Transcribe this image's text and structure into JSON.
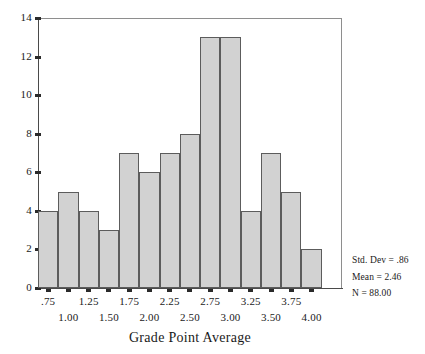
{
  "chart_data": {
    "type": "bar",
    "title": "",
    "xlabel": "Grade Point Average",
    "ylabel": "",
    "ylim": [
      0,
      14
    ],
    "grid": false,
    "legend": "none",
    "bin_width": 0.25,
    "categories": [
      "0.75",
      "1.00",
      "1.25",
      "1.50",
      "1.75",
      "2.00",
      "2.25",
      "2.50",
      "2.75",
      "3.00",
      "3.25",
      "3.50",
      "3.75",
      "4.00"
    ],
    "values": [
      4,
      5,
      4,
      3,
      7,
      6,
      7,
      8,
      13,
      13,
      4,
      7,
      5,
      2
    ],
    "y_ticks": [
      "0",
      "2",
      "4",
      "6",
      "8",
      "10",
      "12",
      "14"
    ],
    "y_tick_values": [
      0,
      2,
      4,
      6,
      8,
      10,
      12,
      14
    ],
    "x_ticks_upper": [
      ".75",
      "1.25",
      "1.75",
      "2.25",
      "2.75",
      "3.25",
      "3.75"
    ],
    "x_ticks_lower": [
      "1.00",
      "1.50",
      "2.00",
      "2.50",
      "3.00",
      "3.50",
      "4.00"
    ],
    "annotations": [
      "Std. Dev = .86",
      "Mean = 2.46",
      "N = 88.00"
    ]
  },
  "stats": {
    "std_dev": "Std. Dev = .86",
    "mean": "Mean = 2.46",
    "n": "N = 88.00"
  },
  "colors": {
    "bar_fill": "#d2d2d2",
    "bar_border": "#5c5c5c",
    "axis": "#4a4a4a",
    "frame": "#8e8e8e",
    "text": "#1a1a1a"
  }
}
